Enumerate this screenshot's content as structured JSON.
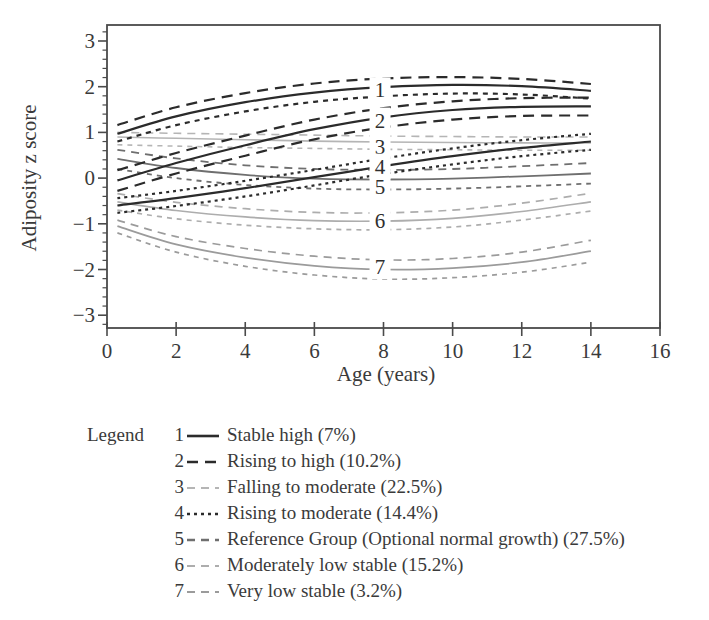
{
  "legend": {
    "title": "Legend"
  },
  "chart_data": {
    "type": "line",
    "title": "",
    "xlabel": "Age (years)",
    "ylabel": "Adiposity z score",
    "xlim": [
      0,
      16
    ],
    "ylim": [
      -3.28,
      3.35
    ],
    "grid": false,
    "x_major_ticks": [
      0,
      2,
      4,
      6,
      8,
      10,
      12,
      14,
      16
    ],
    "x_tick_labels": [
      "0",
      "2",
      "4",
      "6",
      "8",
      "10",
      "12",
      "14",
      "16"
    ],
    "y_major_ticks": [
      3,
      2,
      1,
      0,
      -1,
      -2,
      -3
    ],
    "y_tick_labels": [
      "3",
      "2",
      "1",
      "0",
      "−1",
      "−2",
      "−3"
    ],
    "y_minor_tick_step": 0.2,
    "curve_label_x": 7.9,
    "axis_color": "#4a4a4a",
    "text_color": "#3a3a3a",
    "x": [
      0.3,
      2,
      4,
      6,
      8,
      10,
      12,
      14
    ],
    "series": [
      {
        "num": "1",
        "name": "Stable high",
        "percent": "7%",
        "legend_label": "Stable high (7%)",
        "color": "#2b2b2b",
        "lw": 2.2,
        "legend_style": "solid",
        "center_style": "solid",
        "upper_style": "long-dash",
        "lower_style": "short-dash",
        "center": [
          0.97,
          1.35,
          1.66,
          1.87,
          1.99,
          2.04,
          2.01,
          1.91
        ],
        "upper": [
          1.16,
          1.55,
          1.86,
          2.07,
          2.18,
          2.21,
          2.17,
          2.06
        ],
        "lower": [
          0.8,
          1.16,
          1.46,
          1.67,
          1.79,
          1.85,
          1.83,
          1.74
        ],
        "label_z": 1.93
      },
      {
        "num": "2",
        "name": "Rising to high",
        "percent": "10.2%",
        "legend_label": "Rising to high (10.2%)",
        "color": "#2b2b2b",
        "lw": 2.2,
        "legend_style": "long-dash",
        "center_style": "solid",
        "upper_style": "long-dash",
        "lower_style": "long-dash",
        "center": [
          -0.05,
          0.33,
          0.72,
          1.07,
          1.33,
          1.49,
          1.56,
          1.57
        ],
        "upper": [
          0.17,
          0.55,
          0.93,
          1.28,
          1.53,
          1.68,
          1.75,
          1.76
        ],
        "lower": [
          -0.28,
          0.1,
          0.49,
          0.85,
          1.11,
          1.28,
          1.36,
          1.37
        ],
        "label_z": 1.27
      },
      {
        "num": "3",
        "name": "Falling to moderate",
        "percent": "22.5%",
        "legend_label": "Falling to moderate (22.5%)",
        "color": "#b5b5b5",
        "lw": 1.6,
        "legend_style": "dash",
        "center_style": "solid",
        "upper_style": "dash",
        "lower_style": "short-dash",
        "center": [
          0.9,
          0.87,
          0.84,
          0.81,
          0.79,
          0.78,
          0.77,
          0.77
        ],
        "upper": [
          1.0,
          0.98,
          0.96,
          0.94,
          0.92,
          0.91,
          0.9,
          0.9
        ],
        "lower": [
          0.73,
          0.7,
          0.67,
          0.65,
          0.63,
          0.62,
          0.61,
          0.61
        ],
        "label_z": 0.7
      },
      {
        "num": "4",
        "name": "Rising to moderate",
        "percent": "14.4%",
        "legend_label": "Rising to moderate (14.4%)",
        "color": "#2b2b2b",
        "lw": 2.2,
        "legend_style": "dotted",
        "center_style": "solid",
        "upper_style": "dotted",
        "lower_style": "dotted",
        "center": [
          -0.6,
          -0.44,
          -0.22,
          0.02,
          0.26,
          0.48,
          0.66,
          0.8
        ],
        "upper": [
          -0.44,
          -0.28,
          -0.06,
          0.18,
          0.43,
          0.65,
          0.83,
          0.97
        ],
        "lower": [
          -0.76,
          -0.61,
          -0.4,
          -0.16,
          0.09,
          0.3,
          0.48,
          0.62
        ],
        "label_z": 0.26
      },
      {
        "num": "5",
        "name": "Reference Group (Optional normal growth)",
        "percent": "27.5%",
        "legend_label": "Reference Group (Optional normal growth) (27.5%)",
        "color": "#6f6f6f",
        "lw": 1.8,
        "legend_style": "dash",
        "center_style": "solid",
        "upper_style": "dash",
        "lower_style": "short-dash",
        "center": [
          0.42,
          0.22,
          0.07,
          -0.01,
          -0.03,
          -0.01,
          0.04,
          0.1
        ],
        "upper": [
          0.62,
          0.43,
          0.28,
          0.2,
          0.18,
          0.2,
          0.26,
          0.33
        ],
        "lower": [
          0.2,
          0.0,
          -0.15,
          -0.23,
          -0.25,
          -0.23,
          -0.18,
          -0.12
        ],
        "label_z": -0.18
      },
      {
        "num": "6",
        "name": "Moderately low stable",
        "percent": "15.2%",
        "legend_label": "Moderately low stable (15.2%)",
        "color": "#adadad",
        "lw": 1.7,
        "legend_style": "dash",
        "center_style": "solid",
        "upper_style": "dash",
        "lower_style": "short-dash",
        "center": [
          -0.52,
          -0.71,
          -0.85,
          -0.93,
          -0.94,
          -0.88,
          -0.73,
          -0.52
        ],
        "upper": [
          -0.34,
          -0.53,
          -0.67,
          -0.75,
          -0.76,
          -0.7,
          -0.55,
          -0.33
        ],
        "lower": [
          -0.7,
          -0.89,
          -1.03,
          -1.11,
          -1.13,
          -1.07,
          -0.92,
          -0.72
        ],
        "label_z": -0.92
      },
      {
        "num": "7",
        "name": "Very low stable",
        "percent": "3.2%",
        "legend_label": "Very low stable (3.2%)",
        "color": "#9b9b9b",
        "lw": 1.7,
        "legend_style": "dash",
        "center_style": "solid",
        "upper_style": "dash",
        "lower_style": "short-dash",
        "center": [
          -1.05,
          -1.45,
          -1.74,
          -1.92,
          -2.0,
          -1.97,
          -1.84,
          -1.6
        ],
        "upper": [
          -0.92,
          -1.28,
          -1.54,
          -1.71,
          -1.79,
          -1.76,
          -1.62,
          -1.36
        ],
        "lower": [
          -1.2,
          -1.62,
          -1.93,
          -2.12,
          -2.21,
          -2.18,
          -2.06,
          -1.84
        ],
        "label_z": -1.94
      }
    ]
  }
}
